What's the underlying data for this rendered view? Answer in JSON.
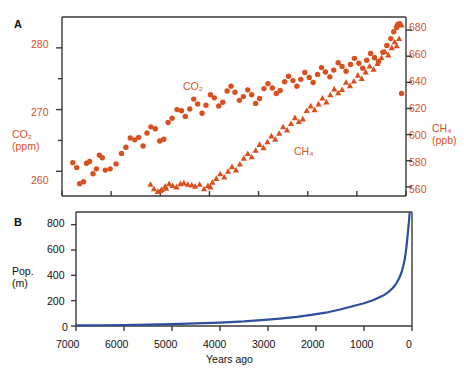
{
  "figure": {
    "panels": [
      {
        "letter": "A",
        "left_axis": {
          "title_line1": "CO₂",
          "title_line2": "(ppm)",
          "ticks": [
            260,
            270,
            280
          ],
          "minor_ticks": [
            265,
            275
          ],
          "range": [
            256,
            285
          ],
          "color": "#D4511E"
        },
        "right_axis": {
          "title_line1": "CH₄",
          "title_line2": "(ppb)",
          "ticks": [
            560,
            580,
            600,
            620,
            640,
            660,
            680
          ],
          "range": [
            553,
            690
          ],
          "color": "#D4511E"
        },
        "series_labels": [
          {
            "name": "co2-label",
            "text": "CO₂"
          },
          {
            "name": "ch4-label",
            "text": "CH₄"
          }
        ]
      },
      {
        "letter": "B",
        "left_axis": {
          "title_line1": "Pop.",
          "title_line2": "(m)",
          "ticks": [
            0,
            200,
            400,
            600,
            800
          ],
          "range": [
            0,
            900
          ],
          "color": "#111111"
        },
        "x_axis": {
          "title": "Years ago",
          "ticks": [
            7000,
            6000,
            5000,
            4000,
            3000,
            2000,
            1000,
            0
          ],
          "range": [
            7000,
            0
          ],
          "color": "#111111"
        }
      }
    ]
  },
  "chart_data": [
    {
      "type": "scatter",
      "panel": "A",
      "title": "",
      "xlabel": "Years ago",
      "xlim": [
        7000,
        0
      ],
      "grid": false,
      "legend": "inline",
      "series": [
        {
          "name": "CO₂",
          "ylabel": "CO₂ (ppm)",
          "ylim": [
            256,
            285
          ],
          "axis": "left",
          "marker": "circle",
          "color": "#D9501F",
          "points": [
            [
              6780,
              261.4
            ],
            [
              6700,
              260.6
            ],
            [
              6640,
              258.0
            ],
            [
              6560,
              258.3
            ],
            [
              6500,
              261.3
            ],
            [
              6440,
              261.6
            ],
            [
              6370,
              259.6
            ],
            [
              6300,
              260.4
            ],
            [
              6240,
              262.6
            ],
            [
              6180,
              262.2
            ],
            [
              6120,
              260.2
            ],
            [
              6020,
              260.4
            ],
            [
              5900,
              261.2
            ],
            [
              5790,
              262.9
            ],
            [
              5700,
              263.9
            ],
            [
              5610,
              265.4
            ],
            [
              5520,
              265.1
            ],
            [
              5440,
              265.5
            ],
            [
              5350,
              264.1
            ],
            [
              5270,
              266.2
            ],
            [
              5190,
              267.2
            ],
            [
              5100,
              266.9
            ],
            [
              5010,
              264.9
            ],
            [
              4930,
              265.2
            ],
            [
              4840,
              267.9
            ],
            [
              4760,
              268.6
            ],
            [
              4660,
              270.0
            ],
            [
              4570,
              269.8
            ],
            [
              4490,
              268.9
            ],
            [
              4400,
              270.1
            ],
            [
              4320,
              271.7
            ],
            [
              4240,
              270.9
            ],
            [
              4150,
              269.4
            ],
            [
              4070,
              270.7
            ],
            [
              3980,
              272.4
            ],
            [
              3900,
              271.9
            ],
            [
              3810,
              270.6
            ],
            [
              3730,
              271.2
            ],
            [
              3640,
              273.0
            ],
            [
              3560,
              273.8
            ],
            [
              3480,
              272.8
            ],
            [
              3390,
              271.5
            ],
            [
              3310,
              272.1
            ],
            [
              3220,
              273.2
            ],
            [
              3140,
              272.4
            ],
            [
              3060,
              271.0
            ],
            [
              2980,
              271.8
            ],
            [
              2890,
              273.4
            ],
            [
              2810,
              274.2
            ],
            [
              2720,
              273.5
            ],
            [
              2640,
              272.6
            ],
            [
              2560,
              273.1
            ],
            [
              2470,
              274.5
            ],
            [
              2390,
              275.4
            ],
            [
              2300,
              274.7
            ],
            [
              2220,
              273.8
            ],
            [
              2140,
              274.9
            ],
            [
              2060,
              276.0
            ],
            [
              1970,
              275.2
            ],
            [
              1890,
              274.4
            ],
            [
              1800,
              275.7
            ],
            [
              1720,
              276.8
            ],
            [
              1640,
              276.1
            ],
            [
              1550,
              275.3
            ],
            [
              1470,
              276.4
            ],
            [
              1380,
              277.6
            ],
            [
              1300,
              277.0
            ],
            [
              1220,
              276.2
            ],
            [
              1130,
              277.3
            ],
            [
              1050,
              278.3
            ],
            [
              960,
              277.5
            ],
            [
              880,
              276.7
            ],
            [
              800,
              278.0
            ],
            [
              720,
              279.1
            ],
            [
              640,
              278.4
            ],
            [
              560,
              277.8
            ],
            [
              470,
              279.3
            ],
            [
              390,
              280.4
            ],
            [
              310,
              281.5
            ],
            [
              250,
              282.6
            ],
            [
              190,
              283.3
            ],
            [
              130,
              283.9
            ],
            [
              90,
              272.6
            ]
          ]
        },
        {
          "name": "CH₄",
          "ylabel": "CH₄ (ppb)",
          "ylim": [
            553,
            690
          ],
          "axis": "right",
          "marker": "triangle",
          "color": "#D9501F",
          "points": [
            [
              5200,
              562.0
            ],
            [
              5130,
              558.5
            ],
            [
              5050,
              556.5
            ],
            [
              4970,
              558.0
            ],
            [
              4900,
              560.5
            ],
            [
              4820,
              562.5
            ],
            [
              4750,
              561.0
            ],
            [
              4670,
              560.0
            ],
            [
              4590,
              562.5
            ],
            [
              4520,
              563.0
            ],
            [
              4440,
              562.0
            ],
            [
              4360,
              561.5
            ],
            [
              4290,
              560.5
            ],
            [
              4200,
              562.0
            ],
            [
              4110,
              558.5
            ],
            [
              4030,
              561.0
            ],
            [
              3940,
              563.5
            ],
            [
              3860,
              566.5
            ],
            [
              3780,
              570.0
            ],
            [
              3700,
              567.5
            ],
            [
              3620,
              572.0
            ],
            [
              3540,
              575.5
            ],
            [
              3460,
              573.0
            ],
            [
              3380,
              577.5
            ],
            [
              3300,
              582.0
            ],
            [
              3220,
              585.5
            ],
            [
              3140,
              583.0
            ],
            [
              3060,
              588.0
            ],
            [
              2980,
              592.5
            ],
            [
              2900,
              590.0
            ],
            [
              2820,
              594.5
            ],
            [
              2740,
              599.0
            ],
            [
              2660,
              596.5
            ],
            [
              2580,
              601.0
            ],
            [
              2500,
              606.0
            ],
            [
              2420,
              603.5
            ],
            [
              2340,
              608.5
            ],
            [
              2260,
              613.0
            ],
            [
              2180,
              610.0
            ],
            [
              2100,
              612.0
            ],
            [
              2020,
              618.5
            ],
            [
              1940,
              622.0
            ],
            [
              1860,
              619.0
            ],
            [
              1780,
              623.5
            ],
            [
              1700,
              628.0
            ],
            [
              1620,
              625.0
            ],
            [
              1540,
              630.5
            ],
            [
              1460,
              635.0
            ],
            [
              1380,
              632.0
            ],
            [
              1300,
              634.5
            ],
            [
              1220,
              640.0
            ],
            [
              1140,
              637.5
            ],
            [
              1060,
              641.0
            ],
            [
              980,
              645.5
            ],
            [
              900,
              643.0
            ],
            [
              820,
              648.0
            ],
            [
              740,
              652.5
            ],
            [
              660,
              650.0
            ],
            [
              580,
              654.5
            ],
            [
              500,
              659.0
            ],
            [
              430,
              663.5
            ],
            [
              360,
              661.0
            ],
            [
              290,
              666.5
            ],
            [
              230,
              671.0
            ],
            [
              190,
              668.0
            ],
            [
              140,
              673.5
            ],
            [
              190,
              684.5
            ],
            [
              90,
              684.0
            ],
            [
              5000,
              557.0
            ],
            [
              4880,
              559.0
            ],
            [
              3980,
              560.0
            ]
          ]
        }
      ]
    },
    {
      "type": "line",
      "panel": "B",
      "title": "",
      "xlabel": "Years ago",
      "ylabel": "Pop. (m)",
      "xlim": [
        7000,
        0
      ],
      "ylim": [
        0,
        900
      ],
      "grid": false,
      "color": "#2B4F9E",
      "series": [
        {
          "name": "World population (millions)",
          "x": [
            7000,
            6500,
            6000,
            5500,
            5000,
            4500,
            4000,
            3500,
            3000,
            2700,
            2400,
            2100,
            1800,
            1500,
            1200,
            1000,
            800,
            600,
            500,
            400,
            330,
            270,
            220,
            180,
            150,
            120,
            100,
            80,
            60,
            50
          ],
          "values": [
            5,
            6,
            8,
            11,
            15,
            20,
            27,
            36,
            50,
            60,
            72,
            88,
            105,
            130,
            160,
            180,
            205,
            240,
            265,
            300,
            335,
            375,
            420,
            475,
            530,
            610,
            680,
            760,
            840,
            890
          ]
        }
      ]
    }
  ]
}
